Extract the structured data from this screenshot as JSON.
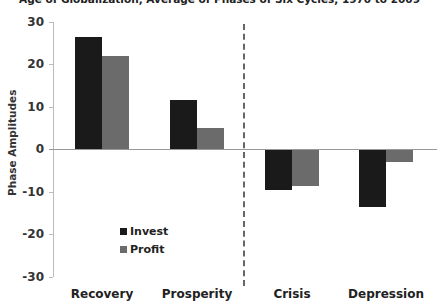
{
  "chart_data": {
    "type": "bar",
    "title": "Age of Globalization, Average of Phases of Six Cycles, 1970 to 2009",
    "xlabel": "",
    "ylabel": "Phase Amplitudes",
    "ylim": [
      -30,
      30
    ],
    "yticks": [
      "30",
      "20",
      "10",
      "0",
      "-10",
      "-20",
      "-30"
    ],
    "categories": [
      "Recovery",
      "Prosperity",
      "Crisis",
      "Depression"
    ],
    "series": [
      {
        "name": "Invest",
        "color": "#1a1a1a",
        "values": [
          26.5,
          11.5,
          -9.5,
          -13.5
        ]
      },
      {
        "name": "Profit",
        "color": "#6b6b6b",
        "values": [
          22,
          5,
          -8.5,
          -2.8
        ]
      }
    ],
    "grid": false,
    "legend_position": "lower-left inside plot",
    "annotations": [
      "dashed vertical divider between Prosperity and Crisis"
    ]
  }
}
